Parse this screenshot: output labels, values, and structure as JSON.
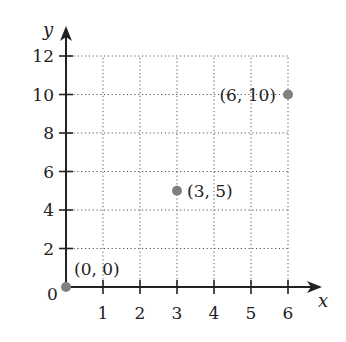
{
  "chart_data": {
    "type": "scatter",
    "title": "",
    "xlabel": "x",
    "ylabel": "y",
    "xlim": [
      0,
      6
    ],
    "ylim": [
      0,
      12
    ],
    "grid": true,
    "grid_style": "dotted",
    "x_ticks": [
      1,
      2,
      3,
      4,
      5,
      6
    ],
    "y_ticks": [
      2,
      4,
      6,
      8,
      10,
      12
    ],
    "origin_label": "0",
    "series": [
      {
        "name": "points",
        "color": "#808080",
        "points": [
          {
            "x": 0,
            "y": 0,
            "label": "(0, 0)"
          },
          {
            "x": 3,
            "y": 5,
            "label": "(3, 5)"
          },
          {
            "x": 6,
            "y": 10,
            "label": "(6, 10)"
          }
        ]
      }
    ]
  },
  "layout": {
    "origin_px": [
      66,
      287
    ],
    "x_unit_px": 37,
    "y_unit_px": 19.25,
    "axis_color": "#222222",
    "grid_color": "#555555",
    "point_color": "#808080"
  }
}
